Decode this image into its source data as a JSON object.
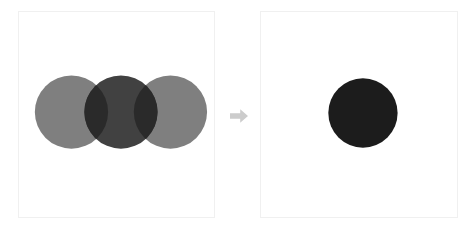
{
  "figure": {
    "title": "Overlapping circles blended into a single shape",
    "background_color": "#ffffff",
    "panel_border_color": "#f0f0f0",
    "panel_fill_color": "#ffffff"
  },
  "arrow": {
    "icon": "arrow-right-icon",
    "label": "becomes",
    "color": "#cccccc",
    "direction": "right"
  },
  "panels": [
    {
      "id": "before",
      "name": "source-panel",
      "label": "Three overlapping circles",
      "x": 18,
      "y": 11,
      "width": 197,
      "height": 207
    },
    {
      "id": "after",
      "name": "result-panel",
      "label": "Single merged circle",
      "x": 260,
      "y": 11,
      "width": 198,
      "height": 207
    }
  ],
  "colors": {
    "light_gray_circle": "#7f7f7f",
    "dark_gray_circle": "#414141",
    "overlap_lens": "#2a2a2a",
    "result_circle": "#1c1c1c"
  },
  "shapes": {
    "before_circles": [
      {
        "name": "left-circle",
        "order": 1,
        "cx": 53,
        "cy": 101,
        "r": 37,
        "fill": "#7f7f7f",
        "tone": "light gray"
      },
      {
        "name": "middle-circle",
        "order": 2,
        "cx": 103,
        "cy": 101,
        "r": 37,
        "fill": "#414141",
        "tone": "dark gray"
      },
      {
        "name": "right-circle",
        "order": 3,
        "cx": 153,
        "cy": 101,
        "r": 37,
        "fill": "#7f7f7f",
        "tone": "light gray"
      }
    ],
    "overlap_lenses": [
      {
        "name": "left-overlap-lens",
        "between": "left-circle and middle-circle",
        "fill": "#2a2a2a"
      },
      {
        "name": "right-overlap-lens",
        "between": "middle-circle and right-circle",
        "fill": "#2a2a2a"
      }
    ],
    "after_circle": {
      "name": "result-circle",
      "cx": 103,
      "cy": 102,
      "r": 35,
      "fill": "#1c1c1c",
      "tone": "near black"
    }
  }
}
